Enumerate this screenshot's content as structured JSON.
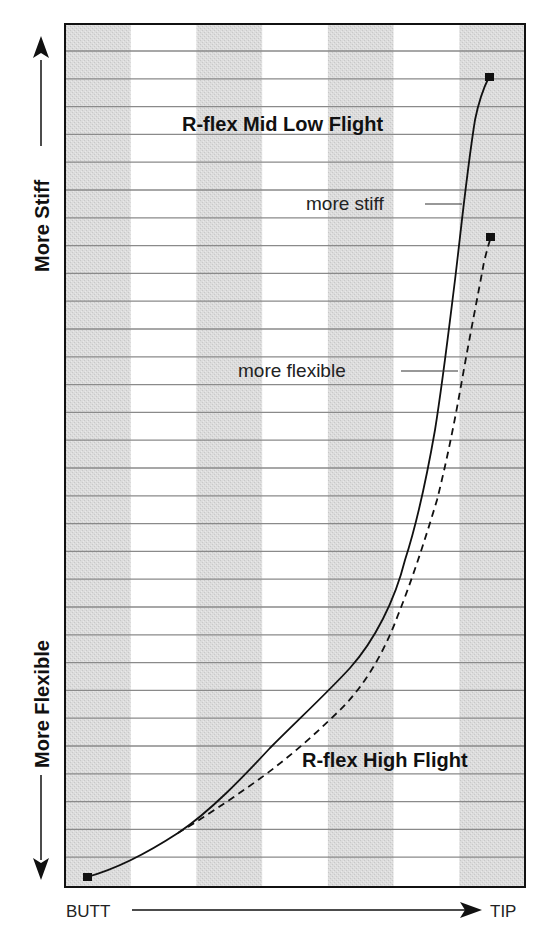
{
  "chart_data": {
    "type": "line",
    "title": "",
    "xlabel": "BUTT → TIP",
    "ylabel": "More Flexible ↔ More Stiff",
    "x_axis": {
      "start_label": "BUTT",
      "end_label": "TIP"
    },
    "y_axis": {
      "top_label": "More Stiff",
      "bottom_label": "More Flexible"
    },
    "grid": {
      "horizontal_lines": 30,
      "vertical_bands": 7
    },
    "legend": "inline labels",
    "annotations": [
      {
        "text": "R-flex Mid Low Flight",
        "style": "bold"
      },
      {
        "text": "more stiff",
        "points_to": "R-flex Mid Low Flight"
      },
      {
        "text": "more flexible",
        "points_to": "R-flex High Flight"
      },
      {
        "text": "R-flex High Flight",
        "style": "bold"
      }
    ],
    "xlim": [
      0,
      100
    ],
    "ylim": [
      0,
      100
    ],
    "series": [
      {
        "name": "R-flex Mid Low Flight",
        "line_style": "solid",
        "x": [
          5,
          25,
          36,
          45,
          53,
          61,
          66,
          71,
          74,
          76,
          79,
          81,
          83,
          85,
          88,
          92,
          93
        ],
        "y": [
          1,
          6,
          11,
          16,
          21,
          25,
          29,
          34,
          40,
          45,
          51,
          58,
          64,
          71,
          80,
          86,
          94
        ]
      },
      {
        "name": "R-flex High Flight",
        "line_style": "dashed",
        "x": [
          25,
          33,
          43,
          51,
          59,
          65,
          70,
          73,
          77,
          80,
          83,
          86,
          89,
          92,
          93
        ],
        "y": [
          6,
          9,
          13,
          16,
          20,
          24,
          29,
          34,
          38,
          45,
          51,
          58,
          65,
          72,
          75
        ]
      }
    ]
  },
  "labels": {
    "y_top": "More Stiff",
    "y_bottom": "More Flexible",
    "x_left": "BUTT",
    "x_right": "TIP",
    "series1": "R-flex Mid Low Flight",
    "series2": "R-flex High Flight",
    "note_stiff": "more stiff",
    "note_flexible": "more flexible"
  },
  "colors": {
    "band_gray": "#d9d9d9",
    "band_white": "#ffffff",
    "gridline": "#8a8a8a",
    "frame": "#111111",
    "curve": "#111111"
  }
}
